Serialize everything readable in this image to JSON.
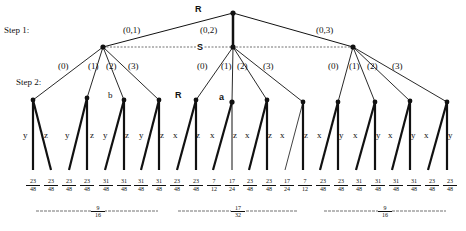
{
  "diagram": {
    "root_label": "R",
    "step_labels": [
      "Step 1:",
      "Step 2:"
    ],
    "info_set_label": "S",
    "step1_edges": [
      "(0,1)",
      "(0,2)",
      "(0,3)"
    ],
    "step2_edges": [
      "(0)",
      "(1)",
      "(2)",
      "(3)"
    ],
    "node_labels": {
      "b": "b",
      "R": "R",
      "a": "a"
    },
    "groups": [
      {
        "edge": "(0,1)",
        "children": [
          {
            "edge": "(0)",
            "left": "y",
            "right": "z"
          },
          {
            "edge": "(1)",
            "left": "y",
            "right": "z"
          },
          {
            "edge": "(2)",
            "left": "y",
            "right": "z"
          },
          {
            "edge": "(3)",
            "left": "y",
            "right": "z"
          }
        ],
        "payoffs": [
          {
            "num": "23",
            "den": "48"
          },
          {
            "num": "23",
            "den": "48"
          },
          {
            "num": "23",
            "den": "48"
          },
          {
            "num": "23",
            "den": "48"
          },
          {
            "num": "31",
            "den": "48"
          },
          {
            "num": "31",
            "den": "48"
          },
          {
            "num": "31",
            "den": "48"
          },
          {
            "num": "31",
            "den": "48"
          }
        ],
        "value": {
          "num": "9",
          "den": "16"
        }
      },
      {
        "edge": "(0,2)",
        "children": [
          {
            "edge": "(0)",
            "left": "x",
            "right": "z"
          },
          {
            "edge": "(1)",
            "left": "x",
            "right": "z"
          },
          {
            "edge": "(2)",
            "left": "x",
            "right": "z"
          },
          {
            "edge": "(3)",
            "left": "x",
            "right": "z"
          }
        ],
        "payoffs": [
          {
            "num": "23",
            "den": "48"
          },
          {
            "num": "23",
            "den": "48"
          },
          {
            "num": "7",
            "den": "12"
          },
          {
            "num": "17",
            "den": "24"
          },
          {
            "num": "23",
            "den": "48"
          },
          {
            "num": "23",
            "den": "48"
          },
          {
            "num": "17",
            "den": "24"
          },
          {
            "num": "7",
            "den": "12"
          }
        ],
        "value": {
          "num": "17",
          "den": "32"
        }
      },
      {
        "edge": "(0,3)",
        "children": [
          {
            "edge": "(0)",
            "left": "x",
            "right": "y"
          },
          {
            "edge": "(1)",
            "left": "x",
            "right": "y"
          },
          {
            "edge": "(2)",
            "left": "x",
            "right": "y"
          },
          {
            "edge": "(3)",
            "left": "x",
            "right": "y"
          }
        ],
        "payoffs": [
          {
            "num": "23",
            "den": "48"
          },
          {
            "num": "23",
            "den": "48"
          },
          {
            "num": "31",
            "den": "48"
          },
          {
            "num": "31",
            "den": "48"
          },
          {
            "num": "31",
            "den": "48"
          },
          {
            "num": "31",
            "den": "48"
          },
          {
            "num": "23",
            "den": "48"
          },
          {
            "num": "23",
            "den": "48"
          }
        ],
        "value": {
          "num": "9",
          "den": "16"
        }
      }
    ]
  }
}
